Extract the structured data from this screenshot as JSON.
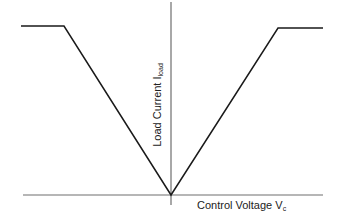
{
  "chart_data": {
    "type": "line",
    "title": "",
    "xlabel": "Control Voltage V_c",
    "ylabel": "Load Current I_load",
    "axis_labels": {
      "x": {
        "main": "Control Voltage V",
        "subscript": "c"
      },
      "y": {
        "main": "Load Current I",
        "subscript": "load"
      }
    },
    "x_ticks": [],
    "y_ticks": [],
    "grid": false,
    "legend": null,
    "units": "normalized (no numeric ticks shown)",
    "xlim": [
      -1.0,
      1.0
    ],
    "ylim": [
      0,
      1.05
    ],
    "series": [
      {
        "name": "Load current vs control voltage",
        "x": [
          -1.0,
          -0.71,
          0.0,
          0.71,
          1.0
        ],
        "y": [
          1.0,
          1.0,
          0.0,
          0.99,
          0.99
        ]
      }
    ],
    "annotations": [
      "V-shaped characteristic: load current rises linearly with |V_c| and saturates (flat plateau) at both ends"
    ]
  },
  "render": {
    "axes": {
      "y_axis": {
        "x": 171,
        "y1": 2,
        "y2": 205
      },
      "x_axis": {
        "y": 195,
        "x1": 23,
        "x2": 323
      }
    },
    "curve_points": "21,26 64,26 171,195 278,28 323,28",
    "colors": {
      "curve": "#1a1a1a",
      "axis": "#6e6e6e",
      "text": "#222222",
      "background": "#ffffff"
    }
  }
}
